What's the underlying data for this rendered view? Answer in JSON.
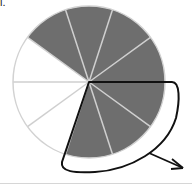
{
  "corner_label": "l.",
  "diagram": {
    "type": "fraction-circle",
    "total_slices": 10,
    "shaded_slices": 7,
    "unshaded_slices": 3,
    "colors": {
      "shaded": "#6e6e6e",
      "unshaded": "#ffffff",
      "divider": "#cfcfcf",
      "arrow": "#111111"
    },
    "annotation": "curved arrow enclosing 3 shaded slices (lower-right), pointing outward"
  }
}
